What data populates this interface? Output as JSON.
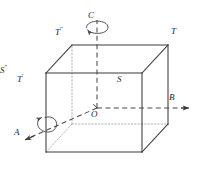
{
  "figure": {
    "kind": "3d-unit-cell-symmetry-axes-diagram",
    "background_color": "#ffffff",
    "line_color": "#3a3a3a",
    "dash_color": "#4a4a4a",
    "dot_color": "#9a9a9a",
    "label_color": "#262626"
  },
  "labels": {
    "axis_c": "C",
    "axis_b": "B",
    "axis_a": "A",
    "origin": "O",
    "point_t": "T",
    "point_t_prime": "T",
    "point_t_prime_mark": "′",
    "point_t_star": "T",
    "point_t_star_mark": "″",
    "point_s": "S",
    "point_s_star": "S",
    "point_s_star_mark": "″"
  },
  "geometry": {
    "front_bottom_left": [
      46,
      152
    ],
    "front_bottom_right": [
      142,
      152
    ],
    "front_top_left": [
      46,
      73
    ],
    "front_top_right": [
      142,
      73
    ],
    "back_bottom_left": [
      72,
      124
    ],
    "back_bottom_right": [
      168,
      124
    ],
    "back_top_left": [
      72,
      45
    ],
    "back_top_right": [
      168,
      45
    ],
    "origin_point": [
      97,
      108
    ],
    "axis_c_top": [
      97,
      18
    ],
    "axis_b_right": [
      190,
      108
    ],
    "axis_a_front": [
      26,
      141
    ]
  }
}
